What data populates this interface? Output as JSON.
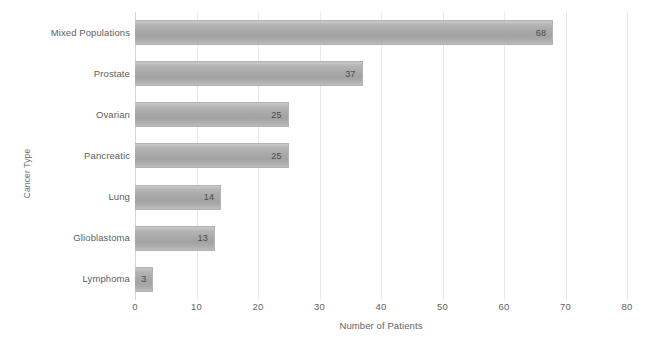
{
  "chart_data": {
    "type": "bar",
    "orientation": "horizontal",
    "title": "",
    "xlabel": "Number of Patients",
    "ylabel": "Cancer Type",
    "categories": [
      "Mixed Populations",
      "Prostate",
      "Ovarian",
      "Pancreatic",
      "Lung",
      "Glioblastoma",
      "Lymphoma"
    ],
    "values": [
      68,
      37,
      25,
      25,
      14,
      13,
      3
    ],
    "data_labels": [
      "68",
      "37",
      "25",
      "25",
      "14",
      "13",
      "3"
    ],
    "xlim": [
      0,
      80
    ],
    "xticks": [
      0,
      10,
      20,
      30,
      40,
      50,
      60,
      70,
      80
    ],
    "xtick_labels": [
      "0",
      "10",
      "20",
      "30",
      "40",
      "50",
      "60",
      "70",
      "80"
    ],
    "grid": "vertical-only",
    "legend": "none",
    "bar_color": "#a8a8a8",
    "grid_color": "#e8e8e8",
    "text_color": "#5e5e5e",
    "background": "#ffffff"
  }
}
